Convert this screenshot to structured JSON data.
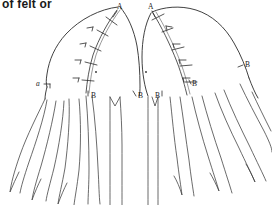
{
  "document": {
    "caption_fragment": "of felt or",
    "type": "line-art pattern diagram",
    "background_color": "#ffffff",
    "ink_color": "#2b2b2b"
  },
  "figures": [
    {
      "id": "left-figure",
      "name": "left-pattern-piece",
      "labels": [
        {
          "id": "left-A",
          "text": "A",
          "style": "upright",
          "x": 117,
          "y": 9,
          "leader": true
        },
        {
          "id": "left-a",
          "text": "a",
          "style": "italic",
          "x": 39,
          "y": 83,
          "leader": true
        },
        {
          "id": "left-B1",
          "text": "B",
          "style": "upright",
          "x": 93,
          "y": 96,
          "leader": true
        },
        {
          "id": "left-B2",
          "text": "B",
          "style": "upright",
          "x": 140,
          "y": 96,
          "leader": true
        }
      ],
      "seam": {
        "stitch_ticks": 5,
        "double_line": true
      },
      "lappets": 5
    },
    {
      "id": "right-figure",
      "name": "right-pattern-piece",
      "labels": [
        {
          "id": "right-A",
          "text": "A",
          "style": "upright",
          "x": 150,
          "y": 9,
          "leader": true
        },
        {
          "id": "right-B1",
          "text": "B",
          "style": "upright",
          "x": 159,
          "y": 96,
          "leader": true
        },
        {
          "id": "right-B2",
          "text": "B",
          "style": "upright",
          "x": 213,
          "y": 80,
          "leader": true
        },
        {
          "id": "right-b",
          "text": "B",
          "style": "upright",
          "x": 245,
          "y": 66,
          "leader": true
        }
      ],
      "seam": {
        "stitch_ticks": 5,
        "double_line": true
      },
      "lappets": 5
    }
  ],
  "annotations": {
    "marker_dots": 2
  }
}
